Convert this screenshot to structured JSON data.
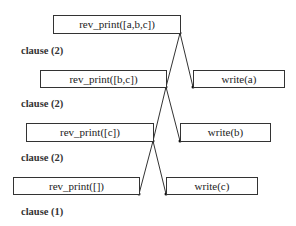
{
  "diagram": {
    "type": "proof-tree",
    "boxes": [
      {
        "id": "call1",
        "label": "rev_print([a,b,c])"
      },
      {
        "id": "call2",
        "label": "rev_print([b,c])"
      },
      {
        "id": "write_a",
        "label": "write(a)"
      },
      {
        "id": "call3",
        "label": "rev_print([c])"
      },
      {
        "id": "write_b",
        "label": "write(b)"
      },
      {
        "id": "call4",
        "label": "rev_print([])"
      },
      {
        "id": "write_c",
        "label": "write(c)"
      }
    ],
    "clauses": [
      {
        "label": "clause (2)"
      },
      {
        "label": "clause (2)"
      },
      {
        "label": "clause (2)"
      },
      {
        "label": "clause (1)"
      }
    ],
    "edges": [
      {
        "from": "call1",
        "to": "call2"
      },
      {
        "from": "call1",
        "to": "write_a"
      },
      {
        "from": "call2",
        "to": "call3"
      },
      {
        "from": "call2",
        "to": "write_b"
      },
      {
        "from": "call3",
        "to": "call4"
      },
      {
        "from": "call3",
        "to": "write_c"
      }
    ]
  }
}
